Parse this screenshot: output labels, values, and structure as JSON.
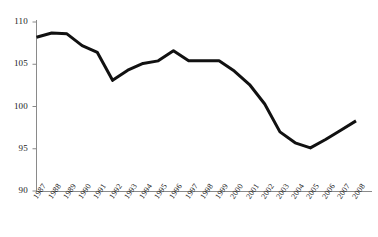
{
  "chart_data": {
    "type": "line",
    "title": "",
    "subtitle": "",
    "xlabel": "",
    "ylabel": "",
    "categories": [
      "1987",
      "1988",
      "1989",
      "1990",
      "1991",
      "1992",
      "1993",
      "1994",
      "1995",
      "1996",
      "1997",
      "1998",
      "1999",
      "2000",
      "2001",
      "2002",
      "2003",
      "2004",
      "2005",
      "2006",
      "2007",
      "2008"
    ],
    "values": [
      108.2,
      108.7,
      108.6,
      107.2,
      106.4,
      103.1,
      104.3,
      105.1,
      105.4,
      106.6,
      105.4,
      105.4,
      105.4,
      104.2,
      102.6,
      100.3,
      97.0,
      95.7,
      95.1,
      96.1,
      97.2,
      98.3
    ],
    "series": [
      {
        "name": "series-1",
        "values": [
          108.2,
          108.7,
          108.6,
          107.2,
          106.4,
          103.1,
          104.3,
          105.1,
          105.4,
          106.6,
          105.4,
          105.4,
          105.4,
          104.2,
          102.6,
          100.3,
          97.0,
          95.7,
          95.1,
          96.1,
          97.2,
          98.3
        ]
      }
    ],
    "ylim": [
      90,
      110
    ],
    "yticks": [
      90,
      95,
      100,
      105,
      110
    ],
    "ytick_labels": [
      "90",
      "95",
      "100",
      "105",
      "110"
    ],
    "xlim": [
      "1987",
      "2008"
    ],
    "grid": false,
    "legend": false,
    "legend_position": "none",
    "line_color": "#111111",
    "axis_color": "#888888",
    "background_color": "#ffffff",
    "line_width": 3,
    "annotations": []
  },
  "axes": {
    "y_axis_name": "value-axis",
    "x_axis_name": "year-axis"
  }
}
